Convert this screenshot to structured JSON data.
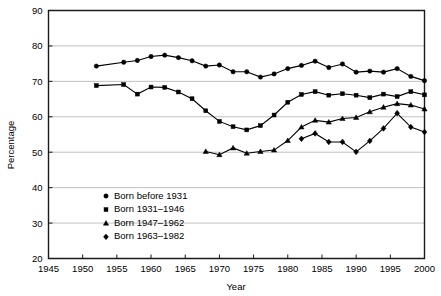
{
  "chart_data": {
    "type": "line",
    "title": "",
    "xlabel": "Year",
    "ylabel": "Percentage",
    "xlim": [
      1945,
      2000
    ],
    "ylim": [
      20,
      90
    ],
    "xticks": [
      1945,
      1950,
      1955,
      1960,
      1965,
      1970,
      1975,
      1980,
      1985,
      1990,
      1995,
      2000
    ],
    "yticks": [
      20,
      30,
      40,
      50,
      60,
      70,
      80,
      90
    ],
    "grid": "horizontal",
    "legend_position": "inside-lower-left",
    "series": [
      {
        "name": "Born before 1931",
        "marker": "circle",
        "color": "#000000",
        "x": [
          1952,
          1956,
          1958,
          1960,
          1962,
          1964,
          1966,
          1968,
          1970,
          1972,
          1974,
          1976,
          1978,
          1980,
          1982,
          1984,
          1986,
          1988,
          1990,
          1992,
          1994,
          1996,
          1998,
          2000
        ],
        "values": [
          74.3,
          75.4,
          75.9,
          77.0,
          77.4,
          76.7,
          75.8,
          74.3,
          74.6,
          72.7,
          72.7,
          71.2,
          72.1,
          73.6,
          74.5,
          75.7,
          73.9,
          74.9,
          72.6,
          72.9,
          72.6,
          73.6,
          71.4,
          70.2
        ]
      },
      {
        "name": "Born 1931–1946",
        "marker": "square",
        "color": "#000000",
        "x": [
          1952,
          1956,
          1958,
          1960,
          1962,
          1964,
          1966,
          1968,
          1970,
          1972,
          1974,
          1976,
          1978,
          1980,
          1982,
          1984,
          1986,
          1988,
          1990,
          1992,
          1994,
          1996,
          1998,
          2000
        ],
        "values": [
          68.8,
          69.1,
          66.4,
          68.4,
          68.3,
          67.0,
          65.1,
          61.7,
          58.7,
          57.2,
          56.3,
          57.5,
          60.5,
          64.1,
          66.3,
          67.1,
          66.1,
          66.5,
          66.1,
          65.4,
          66.4,
          65.7,
          67.1,
          66.2
        ]
      },
      {
        "name": "Born 1947–1962",
        "marker": "triangle",
        "color": "#000000",
        "x": [
          1968,
          1970,
          1972,
          1974,
          1976,
          1978,
          1980,
          1982,
          1984,
          1986,
          1988,
          1990,
          1992,
          1994,
          1996,
          1998,
          2000
        ],
        "values": [
          50.2,
          49.3,
          51.2,
          49.7,
          50.2,
          50.6,
          53.3,
          57.1,
          59.0,
          58.5,
          59.5,
          59.8,
          61.4,
          62.7,
          63.7,
          63.3,
          62.2
        ]
      },
      {
        "name": "Born 1963–1982",
        "marker": "diamond",
        "color": "#000000",
        "x": [
          1982,
          1984,
          1986,
          1988,
          1990,
          1992,
          1994,
          1996,
          1998,
          2000
        ],
        "values": [
          53.8,
          55.3,
          52.9,
          52.9,
          50.1,
          53.2,
          56.7,
          61.0,
          57.1,
          55.7
        ]
      }
    ]
  },
  "legend": {
    "items": [
      {
        "label": "Born before 1931",
        "marker": "circle"
      },
      {
        "label": "Born 1931–1946",
        "marker": "square"
      },
      {
        "label": "Born 1947–1962",
        "marker": "triangle"
      },
      {
        "label": "Born 1963–1982",
        "marker": "diamond"
      }
    ]
  },
  "colors": {
    "ink": "#000000",
    "grid": "#b0b0b0",
    "background": "#ffffff"
  }
}
